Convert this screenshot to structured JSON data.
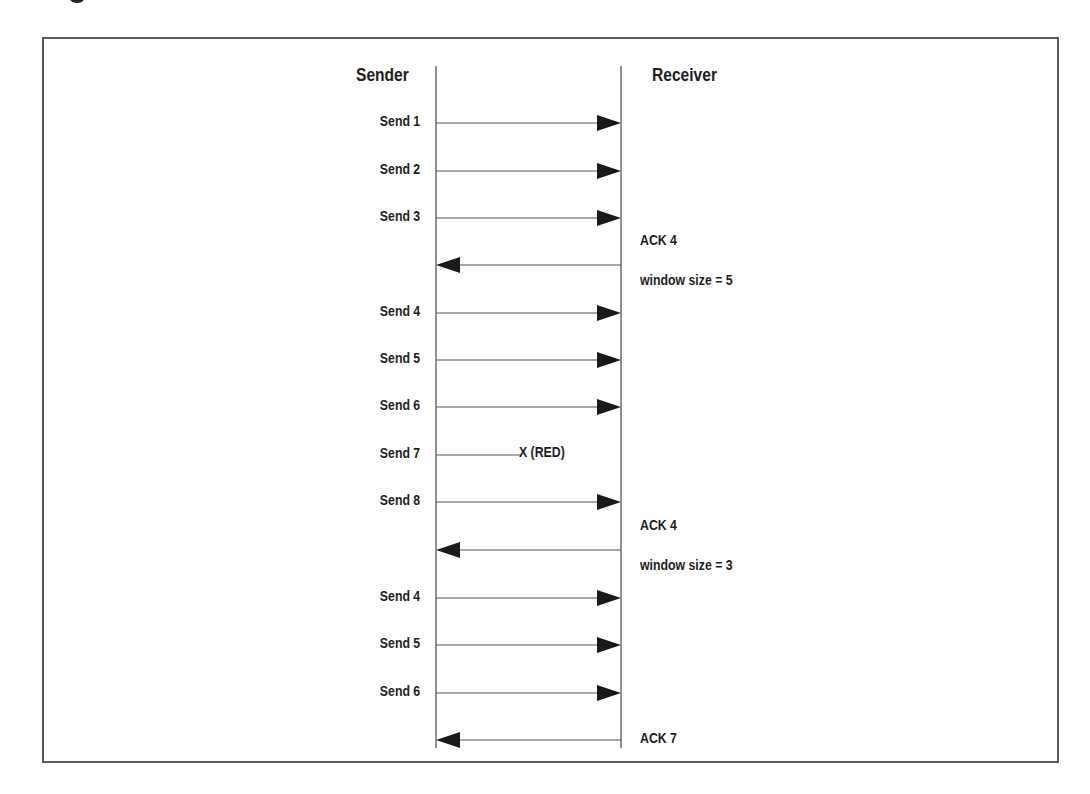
{
  "figure": {
    "header": {
      "sender_label": "Sender",
      "receiver_label": "Receiver"
    },
    "lifelines": {
      "sender_x": 436,
      "receiver_x": 621,
      "top_y": 66,
      "bottom_y": 748
    },
    "colors": {
      "line": "#555555",
      "arrowhead": "#1a1a1a",
      "frame": "#5a5a5a",
      "text": "#1e1e1e"
    },
    "messages": [
      {
        "direction": "send",
        "label": "Send 1",
        "y": 123
      },
      {
        "direction": "send",
        "label": "Send 2",
        "y": 171
      },
      {
        "direction": "send",
        "label": "Send 3",
        "y": 218
      },
      {
        "direction": "ack",
        "label": "ACK 4",
        "sublabel": "window size = 5",
        "y": 265
      },
      {
        "direction": "send",
        "label": "Send 4",
        "y": 313
      },
      {
        "direction": "send",
        "label": "Send 5",
        "y": 360
      },
      {
        "direction": "send",
        "label": "Send 6",
        "y": 407
      },
      {
        "direction": "lost",
        "label": "Send 7",
        "loss_marker": "X (RED)",
        "y": 455
      },
      {
        "direction": "send",
        "label": "Send 8",
        "y": 502
      },
      {
        "direction": "ack",
        "label": "ACK 4",
        "sublabel": "window size = 3",
        "y": 550
      },
      {
        "direction": "send",
        "label": "Send 4",
        "y": 598
      },
      {
        "direction": "send",
        "label": "Send 5",
        "y": 645
      },
      {
        "direction": "send",
        "label": "Send 6",
        "y": 693
      },
      {
        "direction": "ack",
        "label": "ACK 7",
        "y": 740
      }
    ]
  }
}
